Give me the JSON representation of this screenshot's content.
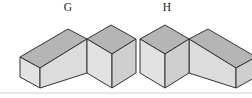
{
  "figure": {
    "canvas": {
      "width": 252,
      "height": 98,
      "background": "#ffffff"
    },
    "baseline_rule": {
      "y": 93,
      "x1": 0,
      "x2": 252,
      "color": "#cfcfcf"
    },
    "palette": {
      "top_face": "#b5b5b5",
      "left_face": "#e2e2e2",
      "front_face": "#dcdcdc",
      "right_face": "#cfcfcf",
      "outline": "#333333",
      "label_color": "#1a1a1a"
    },
    "solids": [
      {
        "id": "G",
        "label": "G",
        "label_x": 68,
        "label_y": 11,
        "description": "L-shaped solid: tall rectangular block at right, low flat block extending left",
        "faces": {
          "tall_top": "87,39 111,25 136,39 112,54",
          "tall_left": "87,39 112,54 112,88 87,73",
          "tall_right": "112,54 136,39 136,73 112,88",
          "low_top": "20,57 68,29 87,39 40,68",
          "low_left": "20,57 40,68 40,88 20,77",
          "low_front": "40,68 87,39 87,73 40,88"
        }
      },
      {
        "id": "H",
        "label": "H",
        "label_x": 167,
        "label_y": 11,
        "description": "Mirror image of G: tall rectangular block at left, low flat block extending right",
        "faces": {
          "tall_top": "140,39 165,25 189,39 165,54",
          "tall_left": "140,39 165,54 165,88 140,73",
          "tall_right": "165,54 189,39 189,73 165,88",
          "low_top": "189,39 208,29 256,57 236,68",
          "low_left": "189,39 236,68 236,88 189,73",
          "low_front": "236,68 256,57 256,77 236,88"
        }
      }
    ]
  }
}
